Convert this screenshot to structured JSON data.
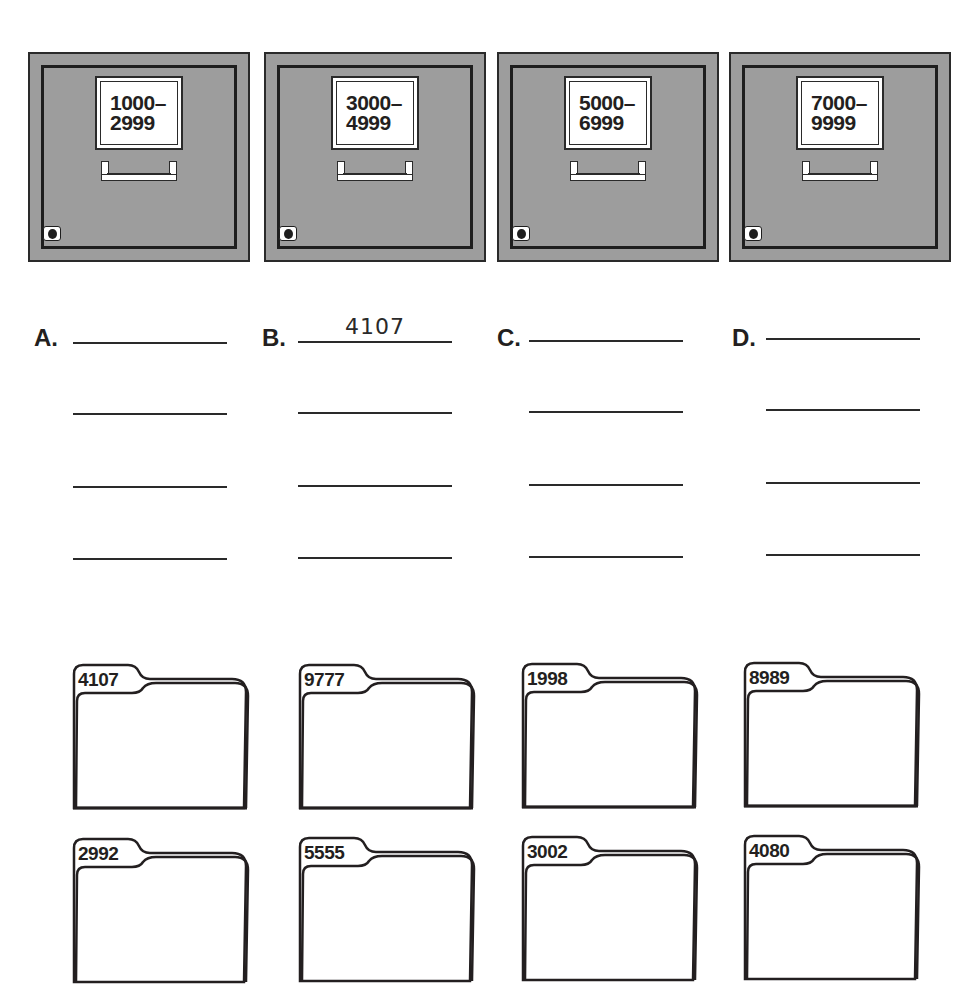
{
  "cabinets": [
    {
      "id": "A",
      "range_line1": "1000–",
      "range_line2": "2999",
      "range": "1000–2999"
    },
    {
      "id": "B",
      "range_line1": "3000–",
      "range_line2": "4999",
      "range": "3000–4999"
    },
    {
      "id": "C",
      "range_line1": "5000–",
      "range_line2": "6999",
      "range": "5000–6999"
    },
    {
      "id": "D",
      "range_line1": "7000–",
      "range_line2": "9999",
      "range": "7000–9999"
    }
  ],
  "answers": [
    {
      "letter": "A.",
      "lines": [
        "",
        "",
        "",
        ""
      ]
    },
    {
      "letter": "B.",
      "lines": [
        "4107",
        "",
        "",
        ""
      ]
    },
    {
      "letter": "C.",
      "lines": [
        "",
        "",
        "",
        ""
      ]
    },
    {
      "letter": "D.",
      "lines": [
        "",
        "",
        "",
        ""
      ]
    }
  ],
  "folders": [
    {
      "number": "4107"
    },
    {
      "number": "9777"
    },
    {
      "number": "1998"
    },
    {
      "number": "8989"
    },
    {
      "number": "2992"
    },
    {
      "number": "5555"
    },
    {
      "number": "3002"
    },
    {
      "number": "4080"
    }
  ],
  "colors": {
    "cabinet_fill": "#9d9d9d",
    "ink": "#231f20",
    "paper": "#ffffff"
  }
}
